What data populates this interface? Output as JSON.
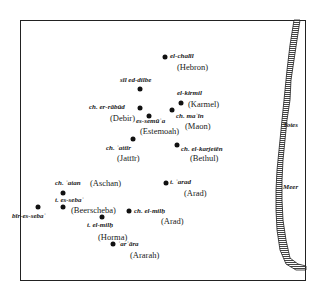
{
  "map": {
    "frame": {
      "left": 20,
      "top": 20,
      "right": 306,
      "bottom": 281
    },
    "colors": {
      "ink": "#111111",
      "background": "#ffffff",
      "coast_hatch": "#555555"
    },
    "sea_labels": [
      {
        "text": "Totes",
        "x": 283,
        "y": 122
      },
      {
        "text": "Meer",
        "x": 283,
        "y": 184
      }
    ],
    "places": [
      {
        "arabic": "el-chalīl",
        "biblical": "(Hebron)",
        "dot": [
          165,
          57
        ],
        "ar_pos": [
          170,
          53
        ],
        "bib_pos": [
          177,
          63
        ]
      },
      {
        "arabic": "sīl ed-dilbe",
        "biblical": "",
        "dot": [
          140,
          89
        ],
        "ar_pos": [
          120,
          77
        ],
        "bib_pos": [
          0,
          0
        ]
      },
      {
        "arabic": "el-kirmil",
        "biblical": "(Karmel)",
        "dot": [
          181,
          103
        ],
        "ar_pos": [
          177,
          90
        ],
        "bib_pos": [
          188,
          100
        ]
      },
      {
        "arabic": "ch. er-rābūd",
        "biblical": "(Debir)",
        "dot": [
          140,
          108
        ],
        "ar_pos": [
          89,
          104
        ],
        "bib_pos": [
          110,
          114
        ]
      },
      {
        "arabic": "es-semūʿa",
        "biblical": "(Estemoah)",
        "dot": [
          149,
          116
        ],
        "ar_pos": [
          136,
          118
        ],
        "bib_pos": [
          140,
          127
        ]
      },
      {
        "arabic": "ch. maʿīn",
        "biblical": "(Maon)",
        "dot": [
          172,
          110
        ],
        "ar_pos": [
          176,
          113
        ],
        "bib_pos": [
          185,
          122
        ]
      },
      {
        "arabic": "ch. ʿattīr",
        "biblical": "(Jattīr)",
        "dot": [
          133,
          139
        ],
        "ar_pos": [
          106,
          145
        ],
        "bib_pos": [
          117,
          154
        ]
      },
      {
        "arabic": "ch. el-karjetēn",
        "biblical": "(Bethul)",
        "dot": [
          177,
          145
        ],
        "ar_pos": [
          181,
          146
        ],
        "bib_pos": [
          190,
          154
        ]
      },
      {
        "arabic": "ch. ʿatan",
        "biblical": "(Aschan)",
        "dot": [
          63,
          193
        ],
        "ar_pos": [
          55,
          180
        ],
        "bib_pos": [
          90,
          179
        ]
      },
      {
        "arabic": "t. es-sebaʿ",
        "biblical": "(Beerscheba)",
        "dot": [
          63,
          207
        ],
        "ar_pos": [
          55,
          197
        ],
        "bib_pos": [
          71,
          206
        ]
      },
      {
        "arabic": "bīr-es-sebaʿ",
        "biblical": "",
        "dot": [
          38,
          207
        ],
        "ar_pos": [
          12,
          213
        ],
        "bib_pos": [
          0,
          0
        ]
      },
      {
        "arabic": "t. ʿarad",
        "biblical": "(Arad)",
        "dot": [
          166,
          183
        ],
        "ar_pos": [
          170,
          179
        ],
        "bib_pos": [
          184,
          189
        ]
      },
      {
        "arabic": "ch. el-milḥ",
        "biblical": "(Arad)",
        "dot": [
          129,
          211
        ],
        "ar_pos": [
          134,
          208
        ],
        "bib_pos": [
          161,
          217
        ]
      },
      {
        "arabic": "t. el-milḥ",
        "biblical": "(Horma)",
        "dot": [
          102,
          217
        ],
        "ar_pos": [
          87,
          222
        ],
        "bib_pos": [
          98,
          233
        ]
      },
      {
        "arabic": "ʿarʿāra",
        "biblical": "(Ararah)",
        "dot": [
          113,
          244
        ],
        "ar_pos": [
          118,
          241
        ],
        "bib_pos": [
          130,
          251
        ]
      }
    ]
  }
}
